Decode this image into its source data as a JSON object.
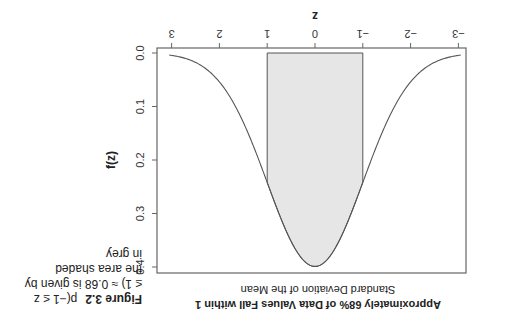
{
  "chart_data": {
    "type": "area",
    "title": "Approximately 68% of Data Values Fall within 1 Standard Deviation of the Mean",
    "title_lines": [
      "Approximately 68% of Data Values Fall within 1",
      "Standard Deviation of the Mean"
    ],
    "xlabel": "z",
    "ylabel": "f(z)",
    "xlim": [
      -3.3,
      3.3
    ],
    "ylim": [
      0.0,
      0.41
    ],
    "x_ticks": [
      -3,
      -2,
      -1,
      0,
      1,
      2,
      3
    ],
    "x_tick_labels": [
      "−3",
      "−2",
      "−1",
      "0",
      "1",
      "2",
      "3"
    ],
    "y_ticks": [
      0.0,
      0.1,
      0.2,
      0.3,
      0.4
    ],
    "y_tick_labels": [
      "0.0",
      "0.1",
      "0.2",
      "0.3",
      "0.4"
    ],
    "series": [
      {
        "name": "Standard normal density f(z)",
        "x": [
          -3.0,
          -2.5,
          -2.0,
          -1.5,
          -1.0,
          -0.5,
          0.0,
          0.5,
          1.0,
          1.5,
          2.0,
          2.5,
          3.0
        ],
        "values": [
          0.0044,
          0.0175,
          0.054,
          0.1295,
          0.242,
          0.3521,
          0.3989,
          0.3521,
          0.242,
          0.1295,
          0.054,
          0.0175,
          0.0044
        ]
      }
    ],
    "shaded_region": {
      "from": -1,
      "to": 1,
      "color": "#e6e6e6",
      "area": 0.68
    },
    "grid": false,
    "orientation_note": "image is rotated 180 degrees"
  },
  "caption": {
    "label": "Figure 3.2",
    "lines": [
      "p(−1 ≤ z",
      "≤ 1) ≈ 0.68 is given by",
      "the area shaded",
      "in grey"
    ]
  },
  "colors": {
    "curve": "#555555",
    "frame": "#666666",
    "shade": "#e6e6e6",
    "text": "#222222"
  }
}
